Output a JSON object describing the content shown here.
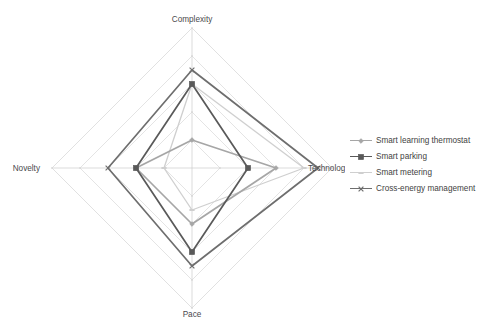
{
  "chart_data": {
    "type": "radar",
    "title": "",
    "categories": [
      "Complexity",
      "Technology",
      "Pace",
      "Novelty"
    ],
    "axis_angles_deg": [
      90,
      0,
      270,
      180
    ],
    "rmin": 0,
    "rmax": 5,
    "rings": 5,
    "grid": true,
    "tick_labels_visible": false,
    "legend_position": "right",
    "series": [
      {
        "name": "Smart learning thermostat",
        "color": "#a6a6a6",
        "marker": "diamond-small",
        "values": [
          1.0,
          3.0,
          2.0,
          2.0
        ]
      },
      {
        "name": "Smart parking",
        "color": "#595959",
        "marker": "square",
        "values": [
          3.0,
          2.0,
          3.0,
          2.0
        ]
      },
      {
        "name": "Smart metering",
        "color": "#cfcfcf",
        "marker": "dash",
        "values": [
          3.0,
          4.0,
          1.5,
          1.0
        ]
      },
      {
        "name": "Cross-energy management",
        "color": "#6e6e6e",
        "marker": "cross",
        "values": [
          3.5,
          4.5,
          3.5,
          3.0
        ]
      }
    ]
  },
  "chart": {
    "axis_labels": {
      "top": "Complexity",
      "right": "Technology",
      "bottom": "Pace",
      "left": "Novelty"
    },
    "grid_color": "#d9d9d9",
    "spoke_color": "#cccccc"
  },
  "legend": {
    "items": [
      {
        "label": "Smart learning thermostat",
        "color": "#a6a6a6",
        "marker": "diamond-small"
      },
      {
        "label": "Smart parking",
        "color": "#595959",
        "marker": "square"
      },
      {
        "label": "Smart metering",
        "color": "#cfcfcf",
        "marker": "dash"
      },
      {
        "label": "Cross-energy management",
        "color": "#6e6e6e",
        "marker": "cross"
      }
    ]
  }
}
